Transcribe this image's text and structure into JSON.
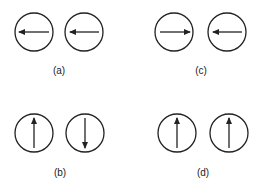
{
  "panels": [
    {
      "label": "(a)",
      "left": "left",
      "right": "left"
    },
    {
      "label": "(c)",
      "left": "right",
      "right": "left"
    },
    {
      "label": "(b)",
      "left": "up",
      "right": "down"
    },
    {
      "label": "(d)",
      "left": "up",
      "right": "up"
    }
  ],
  "colors": {
    "stroke": "#222222",
    "background": "#ffffff"
  }
}
